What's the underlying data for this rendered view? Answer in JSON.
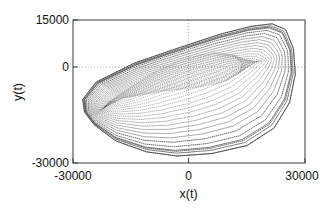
{
  "chart_data": {
    "type": "line",
    "title": "",
    "xlabel": "x(t)",
    "ylabel": "y(t)",
    "xlim": [
      -30000,
      30000
    ],
    "ylim": [
      -30000,
      15000
    ],
    "xticks": [
      -30000,
      0,
      30000
    ],
    "xticklabels": [
      "-30000",
      "0",
      "30000"
    ],
    "yticks": [
      -30000,
      0,
      15000
    ],
    "yticklabels": [
      "-30000",
      "0",
      "15000"
    ],
    "grid": "dotted gridlines at x=0 and y=0 only",
    "legend": "none",
    "style": "dotted/stippled point trace, black, many nested closed orbits",
    "series": [
      {
        "name": "orbit-outer",
        "comment": "outermost closed orbit of the family",
        "x": [
          -27500,
          -24000,
          -14000,
          -2000,
          8000,
          16000,
          21500,
          25000,
          27000,
          27500,
          26000,
          22000,
          15000,
          6000,
          -3000,
          -11000,
          -19000,
          -24500,
          -27000,
          -27500
        ],
        "y": [
          -10000,
          -4500,
          1500,
          6500,
          10500,
          13000,
          13800,
          12000,
          6000,
          -2000,
          -11000,
          -19000,
          -24500,
          -27000,
          -27800,
          -26500,
          -23000,
          -18000,
          -14000,
          -10000
        ]
      },
      {
        "name": "orbit-inner",
        "comment": "innermost closed orbit of the family",
        "x": [
          -22000,
          -17000,
          -6000,
          4000,
          10000,
          13500,
          14000,
          11500,
          6000,
          -2000,
          -10000,
          -17000,
          -21000,
          -22000
        ],
        "y": [
          -12500,
          -9500,
          -7000,
          -5500,
          -4000,
          -1500,
          1500,
          4000,
          4500,
          2500,
          -2000,
          -7500,
          -11000,
          -12500
        ]
      }
    ],
    "n_orbits": 26,
    "x_extent_px": [
      93,
      298
    ],
    "y_extent_px": [
      24,
      155
    ]
  },
  "axes": {
    "y_top_label": "15000",
    "y_mid_label": "0",
    "y_bottom_label": "-30000",
    "x_left_label": "-30000",
    "x_mid_label": "0",
    "x_right_label": "30000",
    "x_axis_title": "x(t)",
    "y_axis_title": "y(t)"
  },
  "colors": {
    "curve": "#2b2b2b",
    "frame": "#3a3a3a",
    "grid": "#9a9a9a",
    "background": "#ffffff",
    "text": "#111111"
  }
}
